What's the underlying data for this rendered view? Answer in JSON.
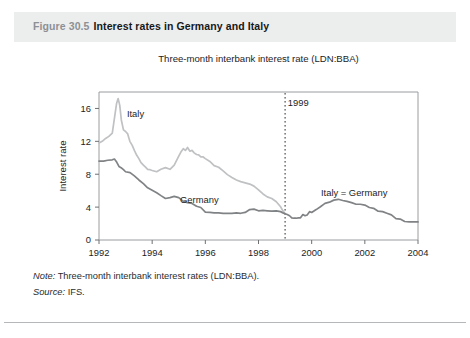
{
  "figure": {
    "number": "Figure 30.5",
    "title": "Interest rates in Germany and Italy"
  },
  "notes": {
    "note_key": "Note:",
    "note_text": " Three-month interbank interest rates (LDN:BBA).",
    "source_key": "Source:",
    "source_text": " IFS."
  },
  "chart_data": {
    "type": "line",
    "title": "Three-month interbank interest rate (LDN:BBA)",
    "xlabel": "Year",
    "ylabel": "Interest rate",
    "xlim": [
      1992,
      2004
    ],
    "ylim": [
      0,
      18
    ],
    "xticks": [
      1992,
      1994,
      1996,
      1998,
      2000,
      2002,
      2004
    ],
    "xticklabels": [
      "1992",
      "1994",
      "1996",
      "1998",
      "2000",
      "2002",
      "2004"
    ],
    "yticks": [
      0,
      4,
      8,
      12,
      16
    ],
    "yticklabels": [
      "0",
      "4",
      "8",
      "12",
      "16"
    ],
    "grid": false,
    "legend": "inline-annotations",
    "annotations": [
      {
        "text": "Italy",
        "x": 1993.05,
        "y": 15.0,
        "color": "#b9bbbd"
      },
      {
        "text": "Germany",
        "x": 1995.05,
        "y": 4.55,
        "color": "#7b7d80"
      },
      {
        "text": "1999",
        "x": 1999.1,
        "y": 16.3,
        "color": "#1b1d1f"
      },
      {
        "text": "Italy  =  Germany",
        "x": 2000.35,
        "y": 5.4,
        "color": "#1b1d1f"
      }
    ],
    "vlines": [
      {
        "x": 1999.0,
        "label": "1999",
        "style": "dotted",
        "color": "#2a2c2e"
      }
    ],
    "series": [
      {
        "name": "Italy",
        "color": "#bfc1c3",
        "x": [
          1992.0,
          1992.12,
          1992.25,
          1992.37,
          1992.5,
          1992.58,
          1992.66,
          1992.72,
          1992.78,
          1992.84,
          1992.92,
          1993.0,
          1993.08,
          1993.16,
          1993.25,
          1993.33,
          1993.42,
          1993.5,
          1993.58,
          1993.67,
          1993.75,
          1993.83,
          1993.92,
          1994.0,
          1994.17,
          1994.33,
          1994.5,
          1994.67,
          1994.83,
          1995.0,
          1995.08,
          1995.17,
          1995.25,
          1995.33,
          1995.42,
          1995.5,
          1995.58,
          1995.67,
          1995.75,
          1995.83,
          1995.92,
          1996.0,
          1996.17,
          1996.33,
          1996.5,
          1996.67,
          1996.83,
          1997.0,
          1997.17,
          1997.33,
          1997.5,
          1997.67,
          1997.83,
          1998.0,
          1998.17,
          1998.33,
          1998.5,
          1998.67,
          1998.83,
          1998.92,
          1999.0
        ],
        "y": [
          11.8,
          12.0,
          12.35,
          12.6,
          13.0,
          14.8,
          16.6,
          17.2,
          16.4,
          14.6,
          13.4,
          13.2,
          12.9,
          12.0,
          11.5,
          10.9,
          10.3,
          9.9,
          9.4,
          9.1,
          8.85,
          8.6,
          8.55,
          8.45,
          8.3,
          8.6,
          8.8,
          8.6,
          9.1,
          10.2,
          10.7,
          11.1,
          10.9,
          11.25,
          10.8,
          10.9,
          10.6,
          10.4,
          10.35,
          10.1,
          10.1,
          9.9,
          9.55,
          9.05,
          8.85,
          8.4,
          7.95,
          7.6,
          7.3,
          7.1,
          6.95,
          6.8,
          6.55,
          6.1,
          5.6,
          5.25,
          5.05,
          4.65,
          4.05,
          3.55,
          3.2
        ]
      },
      {
        "name": "Germany",
        "color": "#808385",
        "x": [
          1992.0,
          1992.17,
          1992.33,
          1992.5,
          1992.58,
          1992.67,
          1992.75,
          1992.83,
          1992.92,
          1993.0,
          1993.17,
          1993.33,
          1993.5,
          1993.67,
          1993.83,
          1994.0,
          1994.17,
          1994.33,
          1994.5,
          1994.67,
          1994.83,
          1995.0,
          1995.17,
          1995.33,
          1995.5,
          1995.67,
          1995.83,
          1996.0,
          1996.17,
          1996.33,
          1996.5,
          1996.67,
          1996.83,
          1997.0,
          1997.17,
          1997.33,
          1997.5,
          1997.67,
          1997.83,
          1998.0,
          1998.17,
          1998.33,
          1998.5,
          1998.67,
          1998.83,
          1998.92,
          1999.0
        ],
        "y": [
          9.6,
          9.6,
          9.7,
          9.75,
          9.85,
          9.45,
          8.95,
          8.8,
          8.55,
          8.3,
          8.2,
          7.8,
          7.3,
          6.85,
          6.35,
          6.05,
          5.75,
          5.4,
          5.05,
          5.15,
          5.3,
          5.15,
          4.7,
          4.55,
          4.45,
          4.1,
          3.95,
          3.4,
          3.35,
          3.3,
          3.3,
          3.25,
          3.25,
          3.25,
          3.3,
          3.25,
          3.35,
          3.7,
          3.75,
          3.55,
          3.6,
          3.55,
          3.5,
          3.55,
          3.45,
          3.3,
          3.2
        ]
      },
      {
        "name": "Italy = Germany (euro area)",
        "color": "#808385",
        "x": [
          1999.0,
          1999.08,
          1999.17,
          1999.25,
          1999.33,
          1999.42,
          1999.5,
          1999.58,
          1999.67,
          1999.75,
          1999.83,
          1999.92,
          2000.0,
          2000.17,
          2000.33,
          2000.5,
          2000.67,
          2000.83,
          2001.0,
          2001.17,
          2001.33,
          2001.5,
          2001.67,
          2001.83,
          2002.0,
          2002.17,
          2002.33,
          2002.5,
          2002.67,
          2002.83,
          2003.0,
          2003.17,
          2003.33,
          2003.5,
          2003.67,
          2003.83,
          2004.0
        ],
        "y": [
          3.2,
          3.1,
          2.95,
          2.7,
          2.65,
          2.65,
          2.7,
          2.7,
          3.1,
          2.95,
          3.05,
          3.45,
          3.35,
          3.7,
          4.05,
          4.45,
          4.6,
          4.85,
          4.95,
          4.8,
          4.7,
          4.55,
          4.35,
          4.35,
          4.25,
          3.95,
          3.85,
          3.5,
          3.45,
          3.25,
          3.05,
          2.6,
          2.55,
          2.25,
          2.2,
          2.2,
          2.2
        ]
      }
    ]
  }
}
